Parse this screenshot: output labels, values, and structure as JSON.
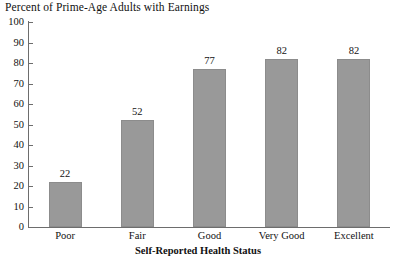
{
  "chart_data": {
    "type": "bar",
    "title": "Percent of Prime-Age Adults with Earnings",
    "xlabel": "Self-Reported Health Status",
    "ylabel": "",
    "categories": [
      "Poor",
      "Fair",
      "Good",
      "Very Good",
      "Excellent"
    ],
    "values": [
      22,
      52,
      77,
      82,
      82
    ],
    "value_labels": [
      "22",
      "52",
      "77",
      "82",
      "82"
    ],
    "ylim": [
      0,
      100
    ],
    "ytick_labels": [
      "100",
      "90",
      "80",
      "70",
      "60",
      "50",
      "40",
      "30",
      "20",
      "10",
      "0"
    ],
    "ytick_values": [
      100,
      90,
      80,
      70,
      60,
      50,
      40,
      30,
      20,
      10,
      0
    ],
    "grid": false,
    "legend": false,
    "bar_color": "#999999",
    "bar_edge_color": "#8c8c8c",
    "axis_color": "#6d6d6d",
    "text_color": "#111111",
    "background_color": "#ffffff"
  }
}
